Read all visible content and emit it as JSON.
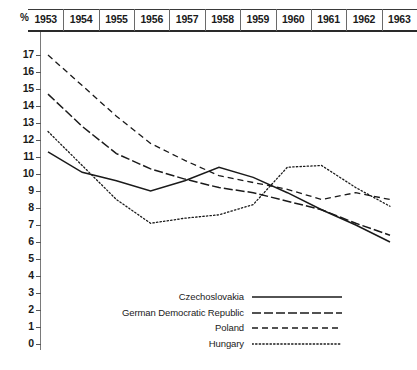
{
  "axis": {
    "y_unit_label": "%",
    "y_ticks": [
      17,
      16,
      15,
      14,
      13,
      12,
      11,
      10,
      9,
      8,
      7,
      6,
      5,
      4,
      3,
      2,
      1,
      0
    ],
    "x_ticks": [
      "1953",
      "1954",
      "1955",
      "1956",
      "1957",
      "1958",
      "1959",
      "1960",
      "1961",
      "1962",
      "1963"
    ]
  },
  "legend": {
    "entries": [
      {
        "label": "Czechoslovakia",
        "style": "solid"
      },
      {
        "label": "German Democratic Republic",
        "style": "dash-dot"
      },
      {
        "label": "Poland",
        "style": "dashed"
      },
      {
        "label": "Hungary",
        "style": "dotted"
      }
    ]
  },
  "chart_data": {
    "type": "line",
    "title": "",
    "xlabel": "",
    "ylabel": "%",
    "x": [
      1953,
      1954,
      1955,
      1956,
      1957,
      1958,
      1959,
      1960,
      1961,
      1962,
      1963
    ],
    "categories": [
      "1953",
      "1954",
      "1955",
      "1956",
      "1957",
      "1958",
      "1959",
      "1960",
      "1961",
      "1962",
      "1963"
    ],
    "ylim": [
      0,
      17
    ],
    "xlim": [
      1953,
      1963
    ],
    "grid": false,
    "legend_position": "bottom-center",
    "series": [
      {
        "name": "Czechoslovakia",
        "style": "solid",
        "values": [
          11.3,
          10.1,
          9.6,
          9.0,
          9.6,
          10.4,
          9.8,
          8.9,
          7.9,
          7.0,
          6.0
        ]
      },
      {
        "name": "German Democratic Republic",
        "style": "dash-dot",
        "values": [
          14.7,
          12.8,
          11.2,
          10.3,
          9.7,
          9.2,
          8.9,
          8.4,
          7.9,
          7.1,
          6.4
        ]
      },
      {
        "name": "Poland",
        "style": "dashed",
        "values": [
          17.0,
          15.2,
          13.4,
          11.8,
          10.8,
          9.9,
          9.5,
          9.1,
          8.5,
          8.9,
          8.5
        ]
      },
      {
        "name": "Hungary",
        "style": "dotted",
        "values": [
          12.5,
          10.5,
          8.5,
          7.1,
          7.4,
          7.6,
          8.2,
          10.4,
          10.5,
          9.2,
          8.1
        ]
      }
    ]
  }
}
